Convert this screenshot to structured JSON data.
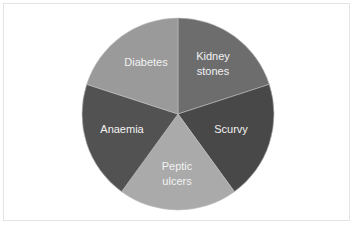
{
  "chart_data": {
    "type": "pie",
    "title": "",
    "categories": [
      "Kidney stones",
      "Scurvy",
      "Peptic ulcers",
      "Anaemia",
      "Diabetes"
    ],
    "values": [
      20,
      20,
      20,
      20,
      20
    ],
    "colors": [
      "#6d6d6d",
      "#484848",
      "#aaaaaa",
      "#525252",
      "#9a9a9a"
    ],
    "start_angle_deg": 0,
    "direction": "clockwise",
    "legend": "none",
    "data_labels": "category name inside slice"
  },
  "labels": {
    "kidney": "Kidney\nstones",
    "scurvy": "Scurvy",
    "peptic": "Peptic\nulcers",
    "anaemia": "Anaemia",
    "diabetes": "Diabetes"
  },
  "title_text": ""
}
